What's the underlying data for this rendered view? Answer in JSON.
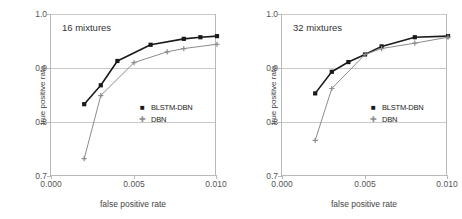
{
  "figure": {
    "background": "#ffffff",
    "panel_count": 2
  },
  "chart_data": [
    {
      "type": "line",
      "title": "16 mixtures",
      "xlabel": "false positive rate",
      "ylabel": "true positive rate",
      "xlim": [
        0.0,
        0.01
      ],
      "ylim": [
        0.7,
        1.0
      ],
      "xticks": [
        "0.000",
        "0.005",
        "0.010"
      ],
      "xtick_values": [
        0.0,
        0.005,
        0.01
      ],
      "yticks": [
        "0.7",
        "0.8",
        "0.9",
        "1.0"
      ],
      "ytick_values": [
        0.7,
        0.8,
        0.9,
        1.0
      ],
      "grid": "horizontal",
      "legend_position": "center-right",
      "series": [
        {
          "name": "BLSTM-DBN",
          "color": "#1a1a1a",
          "marker": "square",
          "x": [
            0.002,
            0.003,
            0.004,
            0.006,
            0.008,
            0.009,
            0.01
          ],
          "values": [
            0.833,
            0.868,
            0.913,
            0.943,
            0.954,
            0.957,
            0.959
          ]
        },
        {
          "name": "DBN",
          "color": "#8c8c8c",
          "marker": "plus",
          "x": [
            0.002,
            0.003,
            0.005,
            0.007,
            0.008,
            0.01
          ],
          "values": [
            0.732,
            0.849,
            0.91,
            0.93,
            0.936,
            0.944
          ]
        }
      ]
    },
    {
      "type": "line",
      "title": "32 mixtures",
      "xlabel": "false positive rate",
      "ylabel": "true positive rate",
      "xlim": [
        0.0,
        0.01
      ],
      "ylim": [
        0.7,
        1.0
      ],
      "xticks": [
        "0.000",
        "0.005",
        "0.010"
      ],
      "xtick_values": [
        0.0,
        0.005,
        0.01
      ],
      "yticks": [
        "0.7",
        "0.8",
        "0.9",
        "1.0"
      ],
      "ytick_values": [
        0.7,
        0.8,
        0.9,
        1.0
      ],
      "grid": "horizontal",
      "legend_position": "center-right",
      "series": [
        {
          "name": "BLSTM-DBN",
          "color": "#1a1a1a",
          "marker": "square",
          "x": [
            0.002,
            0.003,
            0.004,
            0.005,
            0.006,
            0.008,
            0.01
          ],
          "values": [
            0.853,
            0.893,
            0.911,
            0.925,
            0.94,
            0.957,
            0.959
          ]
        },
        {
          "name": "DBN",
          "color": "#8c8c8c",
          "marker": "plus",
          "x": [
            0.002,
            0.003,
            0.005,
            0.006,
            0.008,
            0.01
          ],
          "values": [
            0.766,
            0.862,
            0.925,
            0.936,
            0.946,
            0.957
          ]
        }
      ]
    }
  ],
  "legend": {
    "marker_square": "■",
    "marker_plus": "✚"
  }
}
